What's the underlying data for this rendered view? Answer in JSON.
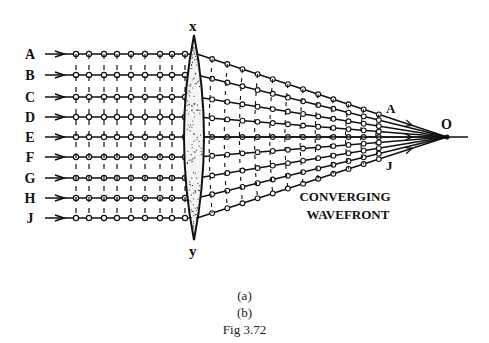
{
  "diagram": {
    "ray_labels": [
      "A",
      "B",
      "C",
      "D",
      "E",
      "F",
      "G",
      "H",
      "J"
    ],
    "ray_y": [
      54,
      75,
      97,
      117,
      137,
      157,
      178,
      198,
      218
    ],
    "lens_top_label": "x",
    "lens_bottom_label": "y",
    "focus_label": "O",
    "upper_ray_label": "A",
    "lower_ray_label": "J",
    "annotation_line1": "CONVERGING",
    "annotation_line2": "WAVEFRONT"
  },
  "captions": {
    "sub_a": "(a)",
    "sub_b": "(b)",
    "figure": "Fig 3.72"
  }
}
